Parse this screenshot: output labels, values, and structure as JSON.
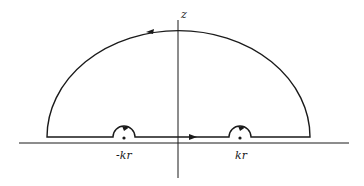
{
  "diagram": {
    "type": "contour-integration-diagram",
    "axes": {
      "vertical_label": "z"
    },
    "poles": [
      {
        "label": "-kr",
        "position": "negative-real-axis"
      },
      {
        "label": "kr",
        "position": "positive-real-axis"
      }
    ],
    "contour": {
      "shape": "upper-half-plane semicircle with indentations above poles",
      "direction": "counter-clockwise",
      "arrows": [
        "top-arc-left",
        "baseline-right",
        "indent-left-right",
        "indent-right-right"
      ]
    },
    "colors": {
      "line": "#1a1a1a",
      "background": "#ffffff"
    }
  }
}
